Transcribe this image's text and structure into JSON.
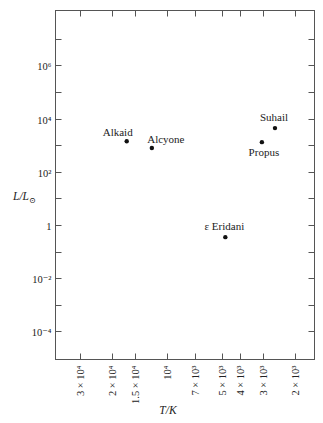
{
  "chart_data": {
    "type": "scatter",
    "title": "",
    "xlabel": "T/K",
    "ylabel": "L/L⊙",
    "x_scale": "log",
    "x_reversed": true,
    "y_scale": "log",
    "xlim": [
      36000,
      1700
    ],
    "ylim": [
      1e-05,
      100000000
    ],
    "grid": false,
    "x_ticks": [
      {
        "value": 30000,
        "label": "3 × 10⁴"
      },
      {
        "value": 20000,
        "label": "2 × 10⁴"
      },
      {
        "value": 15000,
        "label": "1.5 × 10⁴"
      },
      {
        "value": 10000,
        "label": "10⁴"
      },
      {
        "value": 7000,
        "label": "7 × 10³"
      },
      {
        "value": 5000,
        "label": "5 × 10³"
      },
      {
        "value": 4000,
        "label": "4 × 10³"
      },
      {
        "value": 3000,
        "label": "3 × 10³"
      },
      {
        "value": 2000,
        "label": "2 × 10³"
      }
    ],
    "y_ticks": [
      {
        "exp": 7,
        "label": ""
      },
      {
        "exp": 6,
        "label": "10⁶"
      },
      {
        "exp": 5,
        "label": ""
      },
      {
        "exp": 4,
        "label": "10⁴"
      },
      {
        "exp": 3,
        "label": ""
      },
      {
        "exp": 2,
        "label": "10²"
      },
      {
        "exp": 1,
        "label": ""
      },
      {
        "exp": 0,
        "label": "1"
      },
      {
        "exp": -1,
        "label": ""
      },
      {
        "exp": -2,
        "label": "10⁻²"
      },
      {
        "exp": -3,
        "label": ""
      },
      {
        "exp": -4,
        "label": "10⁻⁴"
      }
    ],
    "points": [
      {
        "name": "Alkaid",
        "T": 16600,
        "L": 1400,
        "label_pos": "above-left"
      },
      {
        "name": "Alcyone",
        "T": 12100,
        "L": 780,
        "label_pos": "above-right"
      },
      {
        "name": "Suhail",
        "T": 2570,
        "L": 4400,
        "label_pos": "above"
      },
      {
        "name": "Propus",
        "T": 3030,
        "L": 1300,
        "label_pos": "below"
      },
      {
        "name": "ε Eridani",
        "T": 4800,
        "L": 0.35,
        "label_pos": "above"
      }
    ],
    "legend": null
  }
}
